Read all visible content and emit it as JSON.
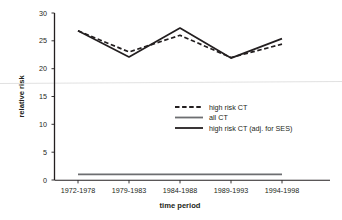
{
  "chart_data": {
    "type": "line",
    "title": "",
    "xlabel": "time period",
    "ylabel": "relative risk",
    "categories": [
      "1972-1978",
      "1979-1983",
      "1984-1988",
      "1989-1993",
      "1994-1998"
    ],
    "ylim": [
      0,
      30
    ],
    "yticks": [
      0,
      5,
      10,
      15,
      20,
      25,
      30
    ],
    "ytick_labels": [
      "0",
      "5",
      "10",
      "15",
      "20",
      "25",
      "30"
    ],
    "grid": false,
    "legend_position": "center-right",
    "series": [
      {
        "name": "high risk CT",
        "style": "dashed",
        "color": "#231f20",
        "values": [
          26.8,
          23.0,
          26.0,
          22.0,
          24.4
        ]
      },
      {
        "name": "all CT",
        "style": "solid",
        "color": "#6d6e71",
        "values": [
          1.0,
          1.0,
          1.0,
          1.0,
          1.0
        ]
      },
      {
        "name": "high risk CT (adj. for SES)",
        "style": "solid",
        "color": "#231f20",
        "values": [
          26.8,
          22.1,
          27.3,
          21.9,
          25.4
        ]
      }
    ]
  },
  "axes": {
    "y_title": "relative risk",
    "x_title": "time period",
    "y_tick_labels": [
      "30",
      "25",
      "20",
      "15",
      "10",
      "5",
      "0"
    ],
    "x_tick_labels": [
      "1972-1978",
      "1979-1983",
      "1984-1988",
      "1989-1993",
      "1994-1998"
    ]
  },
  "legend": {
    "entries": [
      {
        "label": "high risk CT",
        "style": "dashed",
        "color": "#231f20"
      },
      {
        "label": "all CT",
        "style": "solid",
        "color": "#6d6e71"
      },
      {
        "label": "high risk CT (adj. for SES)",
        "style": "solid",
        "color": "#231f20"
      }
    ]
  },
  "colors": {
    "axis": "#231f20",
    "dark_line": "#231f20",
    "gray_line": "#6d6e71",
    "artifact_line": "#d9d9d9",
    "background": "#ffffff"
  }
}
